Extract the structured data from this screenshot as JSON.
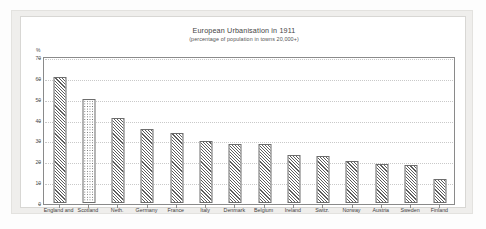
{
  "chart_data": {
    "type": "bar",
    "title": "European Urbanisation in 1911",
    "subtitle": "(percentage of population in towns 20,000+)",
    "xlabel": "",
    "ylabel": "%",
    "ylim": [
      0,
      70
    ],
    "ytick_step": 10,
    "yticks": [
      0,
      10,
      20,
      30,
      40,
      50,
      60,
      70
    ],
    "grid": true,
    "legend": "none",
    "categories": [
      "England and",
      "Scotland",
      "Neth.",
      "Germany",
      "France",
      "Italy",
      "Denmark",
      "Belgium",
      "Ireland",
      "Switz.",
      "Norway",
      "Austria",
      "Sweden",
      "Finland"
    ],
    "values": [
      60.5,
      50,
      41,
      35.5,
      33.5,
      29.5,
      28.5,
      28.5,
      23,
      22.5,
      20,
      18.5,
      18,
      11.5
    ],
    "bar_patterns": [
      "diagonal-hatch",
      "dotted",
      "diagonal-hatch",
      "diagonal-hatch",
      "diagonal-hatch",
      "diagonal-hatch",
      "diagonal-hatch",
      "diagonal-hatch",
      "diagonal-hatch",
      "diagonal-hatch",
      "diagonal-hatch",
      "diagonal-hatch",
      "diagonal-hatch",
      "diagonal-hatch"
    ]
  },
  "colors": {
    "bar_outline": "#6d6d6d",
    "bar_hatch": "#5d5d5d",
    "axis": "#8a8a8a",
    "gridline": "#c9c9c9",
    "panel_background": "#ffffff",
    "frame_background": "#efeeec",
    "text": "#3a3a3a"
  }
}
